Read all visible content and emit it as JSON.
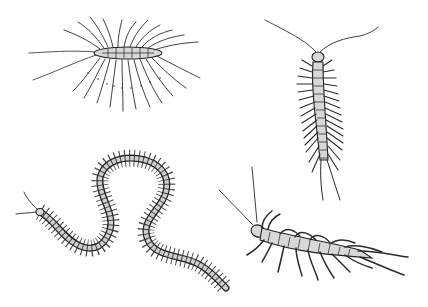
{
  "image": {
    "subject": "Scientific line-drawing illustration of four centipedes",
    "background": "#ffffff",
    "ink_color": "#2a2a2a",
    "figures": [
      {
        "name": "house-centipede",
        "position": "top-left",
        "description": "Scutigera with very long legs radiating around a short body, long antennae to the left"
      },
      {
        "name": "centipede-upright",
        "position": "top-right",
        "description": "Segmented centipede facing up, two curved antennae, paired legs along body"
      },
      {
        "name": "centipede-winding",
        "position": "bottom-left",
        "description": "Long S-shaped winding centipede with many short legs, head at left"
      },
      {
        "name": "centipede-crawling",
        "position": "bottom-right",
        "description": "Shaded centipede crawling diagonally with long straight antennae at upper left"
      }
    ]
  }
}
